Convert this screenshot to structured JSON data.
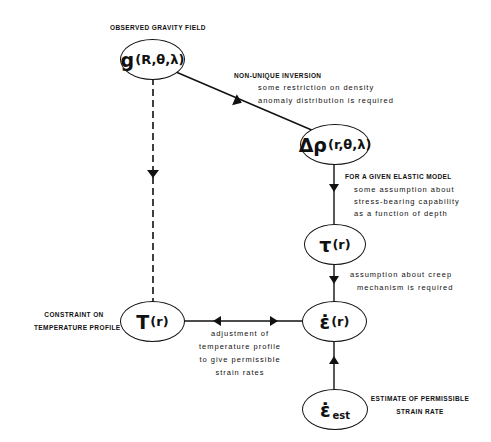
{
  "diagram": {
    "nodes": {
      "gravity": {
        "main": "g",
        "args": "(R,θ,λ)",
        "label": "OBSERVED GRAVITY FIELD"
      },
      "density": {
        "main": "Δρ",
        "args": "(r,θ,λ)"
      },
      "stress": {
        "main": "τ",
        "args": "(r)"
      },
      "strain_rate": {
        "main": "ε̇",
        "args": "(r)"
      },
      "temperature": {
        "main": "T",
        "args": "(r)",
        "label_line1": "CONSTRAINT ON",
        "label_line2": "TEMPERATURE PROFILE"
      },
      "strain_est": {
        "main": "ε̇",
        "sub": "est",
        "label_line1": "ESTIMATE OF PERMISSIBLE",
        "label_line2": "STRAIN RATE"
      }
    },
    "edges": {
      "gravity_to_density": {
        "title": "NON-UNIQUE INVERSION",
        "line1": "some restriction on density",
        "line2": "anomaly distribution is required"
      },
      "density_to_stress": {
        "title": "FOR A GIVEN ELASTIC MODEL",
        "line1": "some assumption about",
        "line2": "stress-bearing capability",
        "line3": "as a function of depth"
      },
      "stress_to_strain": {
        "line1": "assumption about creep",
        "line2": "mechanism is required"
      },
      "temperature_strain": {
        "line1": "adjustment of",
        "line2": "temperature profile",
        "line3": "to give permissible",
        "line4": "strain rates"
      },
      "gravity_to_temperature": {
        "style": "dashed"
      },
      "estimate_to_strain": {
        "style": "solid"
      }
    },
    "colors": {
      "ink": "#111111",
      "background": "#ffffff"
    }
  }
}
